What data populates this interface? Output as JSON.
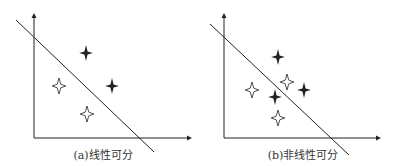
{
  "colors": {
    "ink": "#222222",
    "background": "#ffffff"
  },
  "panels": [
    {
      "id": "a",
      "caption": "(a)线性可分",
      "caption_pos": [
        103,
        146
      ],
      "axes": {
        "origin": [
          34,
          138
        ],
        "y_top": 13,
        "x_right": 192
      },
      "separator": [
        [
          16,
          20
        ],
        [
          154,
          152
        ]
      ],
      "filled_stars": [
        [
          86,
          53
        ],
        [
          112,
          86
        ]
      ],
      "hollow_stars": [
        [
          59,
          86
        ],
        [
          87,
          114
        ]
      ]
    },
    {
      "id": "b",
      "caption": "(b)非线性可分",
      "caption_pos": [
        303,
        146
      ],
      "axes": {
        "origin": [
          224,
          138
        ],
        "y_top": 13,
        "x_right": 381
      },
      "separator": [
        [
          210,
          24
        ],
        [
          349,
          155
        ]
      ],
      "filled_stars": [
        [
          278,
          57
        ],
        [
          304,
          90
        ],
        [
          275,
          97
        ]
      ],
      "hollow_stars": [
        [
          252,
          90
        ],
        [
          287,
          82
        ],
        [
          278,
          118
        ]
      ]
    }
  ]
}
